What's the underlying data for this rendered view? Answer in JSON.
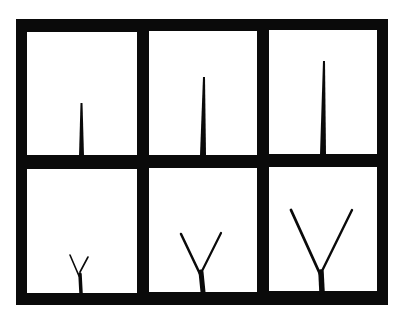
{
  "figure": {
    "frame_color": "#0a0a0a",
    "background_color": "#ffffff",
    "rows": 2,
    "cols": 3,
    "panels": [
      {
        "row": 0,
        "col": 0,
        "stage": "single shoot, short"
      },
      {
        "row": 0,
        "col": 1,
        "stage": "single shoot, medium"
      },
      {
        "row": 0,
        "col": 2,
        "stage": "single shoot, tall"
      },
      {
        "row": 1,
        "col": 0,
        "stage": "forked shoot, small"
      },
      {
        "row": 1,
        "col": 1,
        "stage": "forked shoot, medium"
      },
      {
        "row": 1,
        "col": 2,
        "stage": "forked shoot, large"
      }
    ]
  }
}
